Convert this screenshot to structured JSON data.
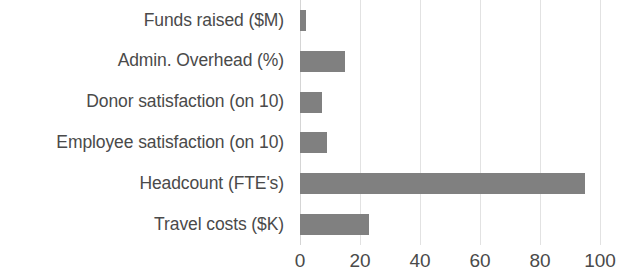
{
  "chart_data": {
    "type": "bar",
    "orientation": "horizontal",
    "title": "",
    "subtitle": "",
    "xlabel": "",
    "ylabel": "",
    "categories": [
      "Funds raised ($M)",
      "Admin. Overhead (%)",
      "Donor satisfaction (on 10)",
      "Employee satisfaction (on 10)",
      "Headcount (FTE's)",
      "Travel costs ($K)"
    ],
    "values": [
      2,
      15,
      7.3,
      9,
      95,
      23
    ],
    "xlim": [
      0,
      100
    ],
    "xticks": [
      0,
      20,
      40,
      60,
      80,
      100
    ],
    "xtick_labels": [
      "0",
      "20",
      "40",
      "60",
      "80",
      "100"
    ],
    "grid": "vertical-only",
    "legend": "none",
    "bar_color": "#808080",
    "gridline_color": "#e2e2e2",
    "axis_color": "#d5d5d5",
    "label_color": "#4a4a4a",
    "background_color": "#ffffff"
  }
}
